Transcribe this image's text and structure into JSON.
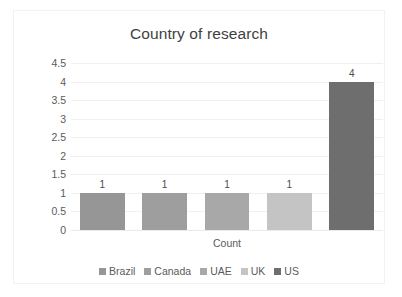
{
  "chart_data": {
    "type": "bar",
    "title": "Country of research",
    "xlabel": "Count",
    "ylabel": "",
    "categories": [
      "Brazil",
      "Canada",
      "UAE",
      "UK",
      "US"
    ],
    "values": [
      1,
      1,
      1,
      1,
      4
    ],
    "data_labels": [
      "1",
      "1",
      "1",
      "1",
      "4"
    ],
    "ylim": [
      0,
      4.5
    ],
    "ytick_labels": [
      "4.5",
      "4",
      "3.5",
      "3",
      "2.5",
      "2",
      "1.5",
      "1",
      "0.5",
      "0"
    ],
    "ytick_values": [
      4.5,
      4,
      3.5,
      3,
      2.5,
      2,
      1.5,
      1,
      0.5,
      0
    ],
    "grid": true,
    "legend_position": "bottom",
    "series_colors": [
      "#969696",
      "#9e9e9e",
      "#a8a8a8",
      "#c4c4c4",
      "#6e6e6e"
    ],
    "legend": [
      {
        "label": "Brazil",
        "color": "#969696"
      },
      {
        "label": "Canada",
        "color": "#9e9e9e"
      },
      {
        "label": "UAE",
        "color": "#a8a8a8"
      },
      {
        "label": "UK",
        "color": "#c4c4c4"
      },
      {
        "label": "US",
        "color": "#6e6e6e"
      }
    ]
  },
  "colors": {
    "title_text": "#3f3f3f",
    "axis_text": "#5b5b5b",
    "gridline": "#f0f0f0",
    "frame_border": "#f2f2f2",
    "background": "#ffffff"
  }
}
